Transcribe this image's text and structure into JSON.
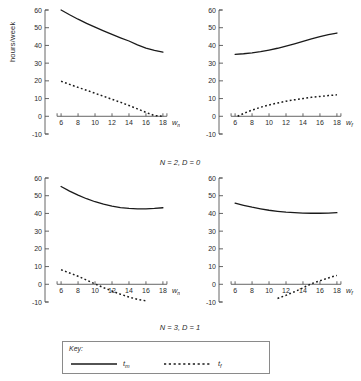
{
  "figure": {
    "ylabel": "hours/week",
    "panel_captions": [
      "N = 2, D = 0",
      "N = 3, D = 1"
    ],
    "legend": {
      "title": "Key:",
      "entries": [
        {
          "label": "tm",
          "label_base": "t",
          "label_sub": "m",
          "style": "solid"
        },
        {
          "label": "tf",
          "label_base": "t",
          "label_sub": "f",
          "style": "dotted"
        }
      ]
    },
    "colors": {
      "ink": "#1a1a1a",
      "axis": "#555555",
      "box": "#8a8a8a"
    }
  },
  "chart_data": [
    {
      "type": "line",
      "panel": "top-left",
      "title": "N = 2, D = 0",
      "xlabel": "w_m",
      "xlabel_base": "w",
      "xlabel_sub": "m",
      "ylabel": "hours/week",
      "xlim": [
        5.4,
        18.6
      ],
      "ylim": [
        -10,
        60
      ],
      "xticks": [
        6,
        8,
        10,
        12,
        14,
        16,
        18
      ],
      "yticks": [
        -10,
        0,
        10,
        20,
        30,
        40,
        50,
        60
      ],
      "grid": false,
      "axis_style": "y-axis-spine-left, x-axis-drawn-at-y0",
      "series": [
        {
          "name": "tm",
          "style": "solid",
          "x": [
            6,
            7,
            8,
            9,
            10,
            11,
            12,
            13,
            14,
            15,
            16,
            17,
            18
          ],
          "values": [
            60.0,
            57.3,
            54.8,
            52.5,
            50.3,
            48.2,
            46.2,
            44.3,
            42.5,
            40.3,
            38.5,
            37.2,
            36.2
          ]
        },
        {
          "name": "tf",
          "style": "dotted",
          "x": [
            6,
            7,
            8,
            9,
            10,
            11,
            12,
            13,
            14,
            15,
            16,
            17,
            18
          ],
          "values": [
            19.8,
            18.0,
            16.3,
            14.7,
            13.0,
            11.3,
            9.6,
            7.9,
            6.1,
            4.2,
            2.2,
            0.4,
            0.0
          ]
        }
      ]
    },
    {
      "type": "line",
      "panel": "top-right",
      "title": "N = 2, D = 0",
      "xlabel": "w_f",
      "xlabel_base": "w",
      "xlabel_sub": "f",
      "ylabel": "hours/week",
      "xlim": [
        5.4,
        18.6
      ],
      "ylim": [
        -10,
        60
      ],
      "xticks": [
        6,
        8,
        10,
        12,
        14,
        16,
        18
      ],
      "yticks": [
        -10,
        0,
        10,
        20,
        30,
        40,
        50,
        60
      ],
      "grid": false,
      "series": [
        {
          "name": "tm",
          "style": "solid",
          "x": [
            6,
            7,
            8,
            9,
            10,
            11,
            12,
            13,
            14,
            15,
            16,
            17,
            18
          ],
          "values": [
            35.0,
            35.3,
            35.8,
            36.5,
            37.4,
            38.4,
            39.6,
            40.9,
            42.3,
            43.7,
            45.0,
            46.1,
            47.0
          ]
        },
        {
          "name": "tf",
          "style": "dotted",
          "x": [
            6.3,
            7,
            8,
            9,
            10,
            11,
            12,
            13,
            14,
            15,
            16,
            17,
            18
          ],
          "values": [
            0.0,
            1.6,
            3.5,
            5.1,
            6.4,
            7.5,
            8.5,
            9.3,
            10.0,
            10.7,
            11.2,
            11.7,
            12.1
          ]
        }
      ]
    },
    {
      "type": "line",
      "panel": "bottom-left",
      "title": "N = 3, D = 1",
      "xlabel": "w_m",
      "xlabel_base": "w",
      "xlabel_sub": "m",
      "ylabel": "hours/week",
      "xlim": [
        5.4,
        18.6
      ],
      "ylim": [
        -10,
        60
      ],
      "xticks": [
        6,
        8,
        10,
        12,
        14,
        16,
        18
      ],
      "yticks": [
        -10,
        0,
        10,
        20,
        30,
        40,
        50,
        60
      ],
      "grid": false,
      "series": [
        {
          "name": "tm",
          "style": "solid",
          "x": [
            6,
            7,
            8,
            9,
            10,
            11,
            12,
            13,
            14,
            15,
            16,
            17,
            18
          ],
          "values": [
            55.2,
            52.6,
            50.3,
            48.3,
            46.6,
            45.2,
            44.1,
            43.3,
            42.8,
            42.6,
            42.6,
            42.8,
            43.2
          ]
        },
        {
          "name": "tf",
          "style": "dotted",
          "x": [
            6,
            7,
            8,
            9,
            10,
            11,
            12,
            13,
            14,
            15,
            16
          ],
          "values": [
            8.2,
            6.4,
            4.5,
            2.4,
            0.2,
            -1.9,
            -3.8,
            -5.6,
            -7.2,
            -8.5,
            -9.3
          ]
        }
      ]
    },
    {
      "type": "line",
      "panel": "bottom-right",
      "title": "N = 3, D = 1",
      "xlabel": "w_f",
      "xlabel_base": "w",
      "xlabel_sub": "f",
      "ylabel": "hours/week",
      "xlim": [
        5.4,
        18.6
      ],
      "ylim": [
        -10,
        60
      ],
      "xticks": [
        6,
        8,
        10,
        12,
        14,
        16,
        18
      ],
      "yticks": [
        -10,
        0,
        10,
        20,
        30,
        40,
        50,
        60
      ],
      "grid": false,
      "series": [
        {
          "name": "tm",
          "style": "solid",
          "x": [
            6,
            7,
            8,
            9,
            10,
            11,
            12,
            13,
            14,
            15,
            16,
            17,
            18
          ],
          "values": [
            45.8,
            44.6,
            43.5,
            42.6,
            41.8,
            41.2,
            40.7,
            40.4,
            40.2,
            40.1,
            40.1,
            40.2,
            40.4
          ]
        },
        {
          "name": "tf",
          "style": "dotted",
          "x": [
            11,
            12,
            13,
            14,
            15,
            16,
            17,
            18
          ],
          "values": [
            -8.0,
            -6.2,
            -4.2,
            -2.0,
            0.3,
            2.0,
            3.6,
            5.0
          ]
        }
      ]
    }
  ]
}
